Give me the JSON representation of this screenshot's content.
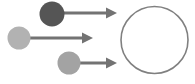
{
  "canvas": {
    "width": 195,
    "height": 84,
    "background": "#ffffff",
    "title": "particles-converging-on-target-circle"
  },
  "palette": {
    "dark_gray": "#555555",
    "light_gray": "#b2b2b2",
    "mid_gray": "#a3a3a3",
    "arrow_gray": "#737373",
    "outline_gray": "#808080",
    "background": "#ffffff"
  },
  "shapes": {
    "source_circles": [
      {
        "id": "circle-dark-top",
        "label": "dark-source-circle",
        "cx": 52,
        "cy": 14,
        "r": 12.5,
        "fill": "#555555",
        "shade": "dark"
      },
      {
        "id": "circle-light-left",
        "label": "light-source-circle",
        "cx": 19,
        "cy": 38,
        "r": 11.5,
        "fill": "#b2b2b2",
        "shade": "light"
      },
      {
        "id": "circle-mid-bottom",
        "label": "medium-source-circle",
        "cx": 69,
        "cy": 63,
        "r": 11.5,
        "fill": "#a3a3a3",
        "shade": "medium"
      }
    ],
    "arrows": [
      {
        "id": "arrow-top",
        "label": "top-arrow",
        "x1": 63,
        "y1": 13,
        "x2": 117,
        "y2": 13,
        "color": "#737373",
        "width": 3,
        "head_length": 11,
        "head_width": 11
      },
      {
        "id": "arrow-middle",
        "label": "middle-arrow",
        "x1": 30,
        "y1": 38,
        "x2": 93,
        "y2": 38,
        "color": "#737373",
        "width": 3,
        "head_length": 11,
        "head_width": 11
      },
      {
        "id": "arrow-bottom",
        "label": "bottom-arrow",
        "x1": 80,
        "y1": 63,
        "x2": 117,
        "y2": 63,
        "color": "#737373",
        "width": 3,
        "head_length": 11,
        "head_width": 11
      }
    ],
    "target_circle": {
      "id": "circle-target-outline",
      "label": "target-outline-circle",
      "cx": 154.5,
      "cy": 40,
      "r": 33.5,
      "stroke": "#808080",
      "stroke_width": 1.6,
      "fill": "none"
    }
  },
  "text": {
    "labels": []
  }
}
